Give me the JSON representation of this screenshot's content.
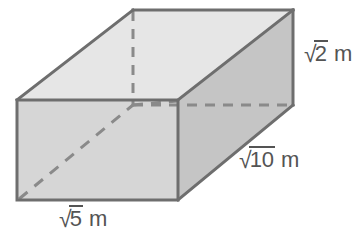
{
  "figure": {
    "kind": "rectangular-prism-diagram",
    "shape_name": "rectangular prism",
    "canvas": {
      "width": 362,
      "height": 246
    },
    "colors": {
      "top_face": "#e6e6e6",
      "front_face": "#d6d6d6",
      "right_face": "#c5c5c5",
      "edge": "#6e6e6e",
      "hidden_edge": "#8a8a8a",
      "label_text": "#545454",
      "background": "#ffffff"
    },
    "labels": {
      "height": {
        "radix": "√",
        "radicand": "2",
        "unit": "m",
        "full": "√2 m"
      },
      "depth": {
        "radix": "√",
        "radicand": "10",
        "unit": "m",
        "full": "√10 m"
      },
      "width": {
        "radix": "√",
        "radicand": "5",
        "unit": "m",
        "full": "√5 m"
      }
    },
    "vertices": {
      "front_top_left": [
        17,
        100
      ],
      "front_top_right": [
        178,
        100
      ],
      "front_bottom_right": [
        178,
        200
      ],
      "front_bottom_left": [
        17,
        200
      ],
      "back_top_left": [
        133,
        10
      ],
      "back_top_right": [
        293,
        10
      ],
      "back_bottom_right": [
        293,
        105
      ],
      "back_bottom_left": [
        133,
        105
      ]
    },
    "faces": {
      "top": "17,100 133,10 293,10 178,100",
      "front": "17,100 178,100 178,200 17,200",
      "right": "178,100 293,10 293,105 178,200"
    },
    "hidden_edges": [
      "M133,10 L133,105",
      "M133,105 L293,105",
      "M133,105 L178,100"
    ],
    "diagonal": "M17,200 L133,105"
  }
}
